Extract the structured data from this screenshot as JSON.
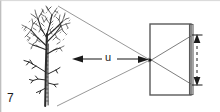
{
  "figure": {
    "number_label": "7",
    "distance_label": "u",
    "width": 220,
    "height": 112,
    "background_color": "#ffffff",
    "line_color": "#6b6b6b",
    "dark_line_color": "#1a1a1a",
    "ink_color": "#2b2b2b"
  },
  "object": {
    "name": "bare deciduous tree",
    "trunk_x": 46,
    "ground_y": 106,
    "top_y": 6
  },
  "camera": {
    "name": "camera box",
    "box": {
      "x": 150,
      "y": 24,
      "width": 42,
      "height": 71
    },
    "film_plane": {
      "x": 190,
      "y": 24,
      "width": 3,
      "height": 71
    },
    "aperture": {
      "x": 150,
      "y": 60
    }
  },
  "rays": {
    "upper_from_object": {
      "x1": 58,
      "y1": 6,
      "x2": 150,
      "y2": 60
    },
    "lower_from_object": {
      "x1": 57,
      "y1": 106,
      "x2": 150,
      "y2": 60
    },
    "upper_to_film": {
      "x1": 150,
      "y1": 60,
      "x2": 190,
      "y2": 36
    },
    "lower_to_film": {
      "x1": 150,
      "y1": 60,
      "x2": 190,
      "y2": 84
    }
  },
  "annotations": {
    "distance_arrow": {
      "x1": 73,
      "y1": 59,
      "x2": 148,
      "y2": 59,
      "label": "u"
    },
    "image_height_arrow": {
      "x": 197,
      "y1": 36,
      "y2": 84
    }
  }
}
